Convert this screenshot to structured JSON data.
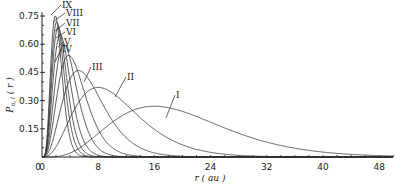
{
  "chart_data": {
    "type": "line",
    "title": "",
    "xlabel": "r ( au )",
    "ylabel": "P n,l ( r )",
    "xlim": [
      0,
      50
    ],
    "ylim": [
      0,
      0.78
    ],
    "x_ticks": [
      0,
      8,
      16,
      24,
      32,
      40,
      48
    ],
    "x_tick_labels": [
      "0",
      "8",
      "16",
      "24",
      "32",
      "40",
      "48"
    ],
    "y_ticks": [
      0.15,
      0.3,
      0.45,
      0.6,
      0.75
    ],
    "y_tick_labels": [
      "0.15",
      "0.30",
      "0.45",
      "0.60",
      "0.75"
    ],
    "origin_label": "0",
    "grid": false,
    "legend": "curve labels with leader lines",
    "series": [
      {
        "name": "I",
        "peak_r": 16.0,
        "peak_p": 0.27,
        "k": 4.0
      },
      {
        "name": "II",
        "peak_r": 8.0,
        "peak_p": 0.37,
        "k": 3.0
      },
      {
        "name": "III",
        "peak_r": 5.2,
        "peak_p": 0.46,
        "k": 3.2
      },
      {
        "name": "IV",
        "peak_r": 3.8,
        "peak_p": 0.54,
        "k": 3.6
      },
      {
        "name": "V",
        "peak_r": 3.1,
        "peak_p": 0.6,
        "k": 4.0
      },
      {
        "name": "VI",
        "peak_r": 2.6,
        "peak_p": 0.65,
        "k": 4.4
      },
      {
        "name": "VII",
        "peak_r": 2.3,
        "peak_p": 0.69,
        "k": 4.8
      },
      {
        "name": "VIII",
        "peak_r": 2.1,
        "peak_p": 0.72,
        "k": 5.2
      },
      {
        "name": "IX",
        "peak_r": 1.9,
        "peak_p": 0.75,
        "k": 5.6
      }
    ],
    "labels": [
      {
        "text": "IX",
        "x": 62,
        "y": 8,
        "line_to": [
          51,
          15
        ]
      },
      {
        "text": "VIII",
        "x": 66,
        "y": 16,
        "line_to": [
          53,
          22
        ]
      },
      {
        "text": "VII",
        "x": 66,
        "y": 26,
        "line_to": [
          55,
          31
        ]
      },
      {
        "text": "VI",
        "x": 66,
        "y": 35,
        "line_to": [
          56,
          38
        ]
      },
      {
        "text": "V",
        "x": 64,
        "y": 45,
        "line_to": [
          58,
          47
        ]
      },
      {
        "text": "IV",
        "x": 62,
        "y": 52,
        "line_to": [
          55,
          62
        ]
      },
      {
        "text": "III",
        "x": 92,
        "y": 70,
        "line_to": [
          84,
          82
        ]
      },
      {
        "text": "II",
        "x": 127,
        "y": 80,
        "line_to": [
          115,
          97
        ]
      },
      {
        "text": "I",
        "x": 176,
        "y": 98,
        "line_to": [
          166,
          118
        ]
      }
    ]
  }
}
